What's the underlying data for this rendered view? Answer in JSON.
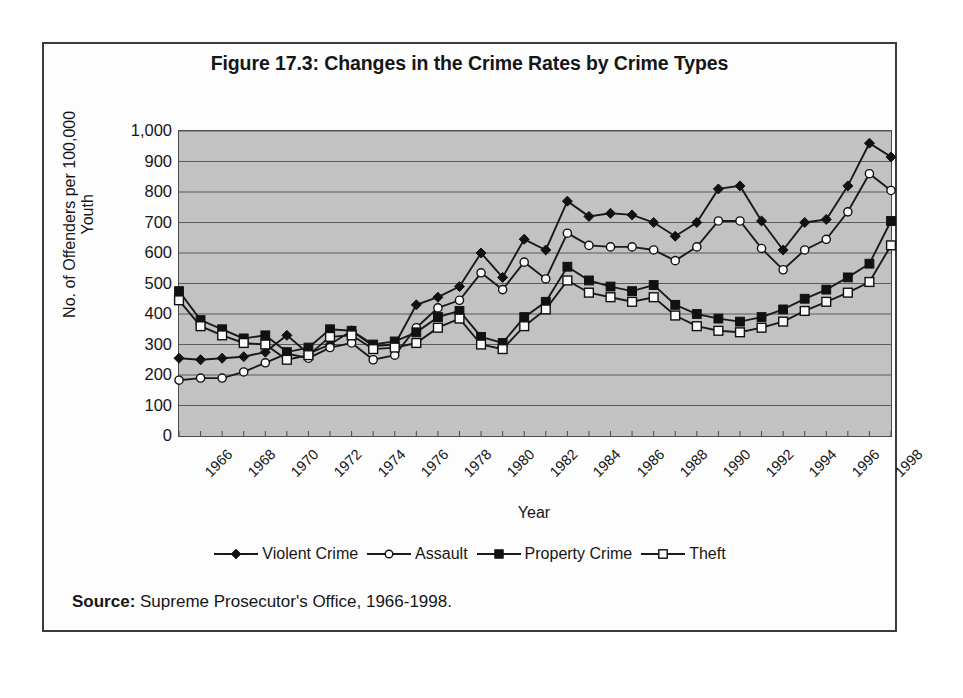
{
  "figure": {
    "title": "Figure 17.3: Changes in the Crime Rates by Crime Types",
    "source_label": "Source:",
    "source_text": " Supreme Prosecutor's Office, 1966-1998."
  },
  "chart_data": {
    "type": "line",
    "title": "Figure 17.3: Changes in the Crime Rates by Crime Types",
    "xlabel": "Year",
    "ylabel": "No. of Offenders per 100,000 Youth",
    "ylim": [
      0,
      1000
    ],
    "ytick_labels": [
      "1,000",
      "900",
      "800",
      "700",
      "600",
      "500",
      "400",
      "300",
      "200",
      "100",
      "0"
    ],
    "ytick_values": [
      1000,
      900,
      800,
      700,
      600,
      500,
      400,
      300,
      200,
      100,
      0
    ],
    "xlim": [
      1966,
      1999
    ],
    "xtick_labels": [
      "1966",
      "1968",
      "1970",
      "1972",
      "1974",
      "1976",
      "1978",
      "1980",
      "1982",
      "1984",
      "1986",
      "1988",
      "1990",
      "1992",
      "1994",
      "1996",
      "1998"
    ],
    "xtick_values": [
      1966,
      1968,
      1970,
      1972,
      1974,
      1976,
      1978,
      1980,
      1982,
      1984,
      1986,
      1988,
      1990,
      1992,
      1994,
      1996,
      1998
    ],
    "x": [
      1966,
      1967,
      1968,
      1969,
      1970,
      1971,
      1972,
      1973,
      1974,
      1975,
      1976,
      1977,
      1978,
      1979,
      1980,
      1981,
      1982,
      1983,
      1984,
      1985,
      1986,
      1987,
      1988,
      1989,
      1990,
      1991,
      1992,
      1993,
      1994,
      1995,
      1996,
      1997,
      1998,
      1999
    ],
    "grid": "horizontal",
    "legend_position": "bottom",
    "plot_background": "#c2c2c2",
    "series": [
      {
        "name": "Violent Crime",
        "marker": "filled-diamond",
        "color": "#1a1a1a",
        "values": [
          255,
          250,
          255,
          260,
          275,
          330,
          270,
          300,
          345,
          295,
          300,
          430,
          455,
          490,
          600,
          520,
          645,
          610,
          770,
          720,
          730,
          725,
          700,
          655,
          700,
          810,
          820,
          705,
          610,
          700,
          710,
          820,
          960,
          915
        ]
      },
      {
        "name": "Assault",
        "marker": "open-circle",
        "color": "#1a1a1a",
        "values": [
          183,
          190,
          190,
          210,
          240,
          270,
          255,
          290,
          305,
          250,
          265,
          355,
          420,
          445,
          535,
          480,
          570,
          515,
          665,
          625,
          620,
          620,
          610,
          575,
          620,
          705,
          705,
          615,
          545,
          610,
          645,
          735,
          860,
          805
        ]
      },
      {
        "name": "Property Crime",
        "marker": "filled-square",
        "color": "#1a1a1a",
        "values": [
          475,
          380,
          350,
          320,
          330,
          275,
          290,
          350,
          345,
          300,
          310,
          340,
          390,
          410,
          325,
          305,
          390,
          440,
          555,
          510,
          490,
          475,
          495,
          430,
          400,
          385,
          375,
          390,
          415,
          450,
          480,
          520,
          565,
          705
        ]
      },
      {
        "name": "Theft",
        "marker": "open-square",
        "color": "#1a1a1a",
        "values": [
          445,
          360,
          330,
          305,
          300,
          250,
          265,
          325,
          330,
          285,
          290,
          305,
          355,
          385,
          300,
          285,
          360,
          415,
          510,
          470,
          455,
          440,
          455,
          395,
          360,
          345,
          340,
          355,
          375,
          410,
          440,
          470,
          505,
          625
        ]
      }
    ]
  }
}
